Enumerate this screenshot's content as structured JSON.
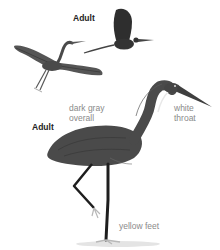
{
  "figure": {
    "colors": {
      "plumage": "#4a4a4a",
      "plumage_dark": "#2b2b2b",
      "throat": "#e8e8e8",
      "legs": "#1e1e1e",
      "feet": "#b8b8b8",
      "shadow": "#e4e4e4",
      "label_text": "#8a8a8a",
      "heading_text": "#222222"
    }
  },
  "labels": {
    "flight_heading": "Adult",
    "standing_heading": "Adult",
    "body_color": [
      "dark gray",
      "overall"
    ],
    "throat_color": [
      "white",
      "throat"
    ],
    "feet_color": "yellow feet"
  },
  "illustrations": [
    {
      "name": "flying-heron-wings-spread",
      "pose": "flight, wings outstretched"
    },
    {
      "name": "flying-heron-wings-raised",
      "pose": "flight, wings raised"
    },
    {
      "name": "standing-heron",
      "pose": "standing on one leg, neck curved"
    }
  ]
}
